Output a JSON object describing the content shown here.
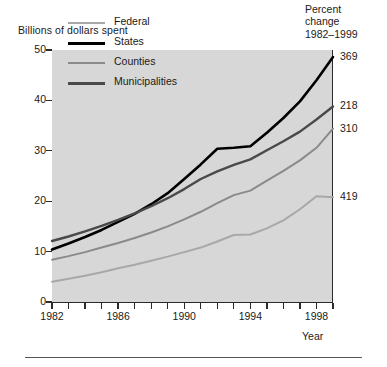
{
  "axis_label_top": "Billions of dollars spent",
  "pct_header": {
    "line1": "Percent",
    "line2": "change",
    "line3": "1982–1999"
  },
  "xaxis_title": "Year",
  "legend": [
    {
      "label": "Federal",
      "color": "#a8a8a8",
      "weight": "thin"
    },
    {
      "label": "States",
      "color": "#000000",
      "weight": "thick"
    },
    {
      "label": "Counties",
      "color": "#8a8a8a",
      "weight": "thin"
    },
    {
      "label": "Municipalities",
      "color": "#4a4a4a",
      "weight": "thick"
    }
  ],
  "pct_values": [
    {
      "series": "States",
      "value": "369"
    },
    {
      "series": "Municipalities",
      "value": "218"
    },
    {
      "series": "Counties",
      "value": "310"
    },
    {
      "series": "Federal",
      "value": "419"
    }
  ],
  "yticks": [
    "0",
    "10",
    "20",
    "30",
    "40",
    "50"
  ],
  "xticks_labeled": [
    "1982",
    "1986",
    "1990",
    "1994",
    "1998"
  ],
  "chart_data": {
    "type": "line",
    "title": "",
    "xlabel": "Year",
    "ylabel": "Billions of dollars spent",
    "xlim": [
      1982,
      1999
    ],
    "ylim": [
      0,
      50
    ],
    "grid": false,
    "legend_position": "top-left-inside",
    "x": [
      1982,
      1983,
      1984,
      1985,
      1986,
      1987,
      1988,
      1989,
      1990,
      1991,
      1992,
      1993,
      1994,
      1995,
      1996,
      1997,
      1998,
      1999
    ],
    "series": [
      {
        "name": "Federal",
        "color": "#a8a8a8",
        "percent_change_1982_1999": 419,
        "values": [
          4.0,
          4.6,
          5.2,
          5.9,
          6.7,
          7.4,
          8.2,
          9.0,
          9.9,
          10.8,
          12.0,
          13.3,
          13.4,
          14.6,
          16.2,
          18.4,
          21.0,
          20.8
        ]
      },
      {
        "name": "States",
        "color": "#000000",
        "percent_change_1982_1999": 369,
        "values": [
          10.4,
          11.6,
          12.9,
          14.3,
          15.9,
          17.5,
          19.4,
          21.6,
          24.4,
          27.3,
          30.4,
          30.6,
          30.9,
          33.6,
          36.5,
          39.8,
          44.0,
          48.6
        ]
      },
      {
        "name": "Counties",
        "color": "#8a8a8a",
        "percent_change_1982_1999": 310,
        "values": [
          8.4,
          9.1,
          9.9,
          10.8,
          11.7,
          12.7,
          13.8,
          15.0,
          16.4,
          17.9,
          19.6,
          21.2,
          22.1,
          24.1,
          26.0,
          28.1,
          30.6,
          34.4
        ]
      },
      {
        "name": "Municipalities",
        "color": "#4a4a4a",
        "percent_change_1982_1999": 218,
        "values": [
          12.1,
          13.0,
          14.0,
          15.1,
          16.3,
          17.6,
          19.0,
          20.6,
          22.4,
          24.4,
          25.9,
          27.2,
          28.3,
          30.1,
          31.9,
          33.8,
          36.2,
          38.8
        ]
      }
    ]
  }
}
